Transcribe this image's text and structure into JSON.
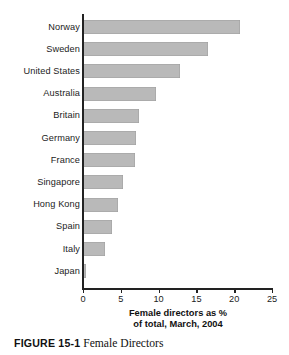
{
  "chart_data": {
    "type": "bar",
    "orientation": "horizontal",
    "title": "",
    "xlabel": "Female directors as % of total, March, 2004",
    "xlabel_lines": [
      "Female directors as %",
      "of total, March, 2004"
    ],
    "ylabel": "",
    "categories": [
      "Norway",
      "Sweden",
      "United States",
      "Australia",
      "Britain",
      "Germany",
      "France",
      "Singapore",
      "Hong Kong",
      "Spain",
      "Italy",
      "Japan"
    ],
    "values": [
      20.8,
      16.5,
      12.8,
      9.7,
      7.4,
      7.0,
      6.9,
      5.3,
      4.6,
      3.8,
      2.9,
      0.4
    ],
    "xlim": [
      0,
      25
    ],
    "xticks": [
      0,
      5,
      10,
      15,
      20,
      25
    ],
    "xtick_labels": [
      "0",
      "5",
      "10",
      "15",
      "20",
      "25"
    ],
    "grid": false,
    "legend": false,
    "bar_color": "#b9b9b9",
    "axis_color": "#222222"
  },
  "caption": {
    "figure_number": "FIGURE 15-1",
    "figure_text": "Female Directors"
  }
}
